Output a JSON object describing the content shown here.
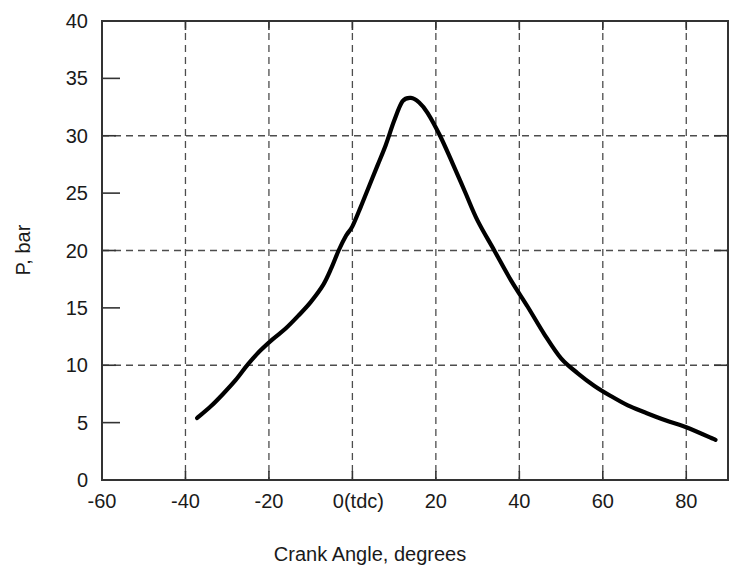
{
  "chart_data": {
    "type": "line",
    "title": "",
    "xlabel": "Crank Angle, degrees",
    "ylabel": "P, bar",
    "xlim": [
      -60,
      90
    ],
    "ylim": [
      0,
      40
    ],
    "grid": true,
    "legend": "none",
    "x_major_ticks": [
      -60,
      -40,
      -20,
      0,
      20,
      40,
      60,
      80
    ],
    "x_tick_labels": [
      "-60",
      "-40",
      "-20",
      "0(tdc)",
      "20",
      "40",
      "60",
      "80"
    ],
    "x_gridline_values": [
      -40,
      -20,
      0,
      20,
      40,
      60,
      80
    ],
    "y_major_ticks": [
      0,
      10,
      20,
      30,
      40
    ],
    "y_minor_ticks": [
      5,
      15,
      25,
      35
    ],
    "y_tick_labels": [
      "0",
      "5",
      "10",
      "15",
      "20",
      "25",
      "30",
      "35",
      "40"
    ],
    "y_tick_values": [
      0,
      5,
      10,
      15,
      20,
      25,
      30,
      35,
      40
    ],
    "y_gridline_values": [
      10,
      20,
      30
    ],
    "series": [
      {
        "name": "Cylinder pressure",
        "color": "#000000",
        "x": [
          -37.2,
          -34,
          -31,
          -28,
          -25,
          -22,
          -19,
          -16,
          -13,
          -10,
          -7,
          -5,
          -3.3,
          -1.5,
          0,
          2,
          4,
          6,
          8,
          10,
          12,
          14,
          16,
          18,
          21,
          24,
          27,
          30,
          34,
          38,
          42,
          46,
          50,
          54,
          58,
          62,
          66,
          70,
          75,
          80,
          87
        ],
        "y": [
          5.4,
          6.4,
          7.5,
          8.7,
          10.1,
          11.3,
          12.3,
          13.2,
          14.3,
          15.5,
          17.0,
          18.5,
          20.0,
          21.3,
          22.1,
          23.8,
          25.6,
          27.4,
          29.2,
          31.3,
          33.0,
          33.3,
          32.9,
          32.0,
          30.0,
          27.6,
          25.1,
          22.6,
          20.0,
          17.4,
          15.1,
          12.7,
          10.6,
          9.3,
          8.2,
          7.3,
          6.5,
          5.9,
          5.2,
          4.6,
          3.5
        ]
      }
    ],
    "annotations": []
  },
  "axes": {
    "x_title": "Crank Angle, degrees",
    "y_title": "P, bar"
  },
  "labels": {
    "x": [
      "-60",
      "-40",
      "-20",
      "0(tdc)",
      "20",
      "40",
      "60",
      "80"
    ],
    "y": [
      "0",
      "5",
      "10",
      "15",
      "20",
      "25",
      "30",
      "35",
      "40"
    ]
  },
  "colors": {
    "curve": "#000000",
    "frame": "#333333",
    "grid": "#4d4d4d",
    "background": "#ffffff",
    "text": "#1a1a1a"
  }
}
